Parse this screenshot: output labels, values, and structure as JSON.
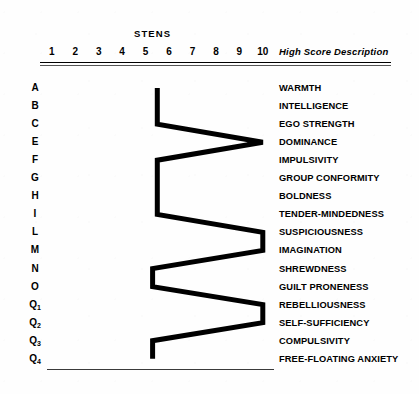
{
  "axis": {
    "factor_label": "FACTOR",
    "stens_title": "STENS",
    "high_score_header": "High Score Description",
    "tick_labels": [
      "1",
      "2",
      "3",
      "4",
      "5",
      "6",
      "7",
      "8",
      "9",
      "10"
    ]
  },
  "rows": [
    {
      "factor": "A",
      "sub": "",
      "description": "WARMTH"
    },
    {
      "factor": "B",
      "sub": "",
      "description": "INTELLIGENCE"
    },
    {
      "factor": "C",
      "sub": "",
      "description": "EGO STRENGTH"
    },
    {
      "factor": "E",
      "sub": "",
      "description": "DOMINANCE"
    },
    {
      "factor": "F",
      "sub": "",
      "description": "IMPULSIVITY"
    },
    {
      "factor": "G",
      "sub": "",
      "description": "GROUP CONFORMITY"
    },
    {
      "factor": "H",
      "sub": "",
      "description": "BOLDNESS"
    },
    {
      "factor": "I",
      "sub": "",
      "description": "TENDER-MINDEDNESS"
    },
    {
      "factor": "L",
      "sub": "",
      "description": "SUSPICIOUSNESS"
    },
    {
      "factor": "M",
      "sub": "",
      "description": "IMAGINATION"
    },
    {
      "factor": "N",
      "sub": "",
      "description": "SHREWDNESS"
    },
    {
      "factor": "O",
      "sub": "",
      "description": "GUILT PRONENESS"
    },
    {
      "factor": "Q",
      "sub": "1",
      "description": "REBELLIOUSNESS"
    },
    {
      "factor": "Q",
      "sub": "2",
      "description": "SELF-SUFFICIENCY"
    },
    {
      "factor": "Q",
      "sub": "3",
      "description": "COMPULSIVITY"
    },
    {
      "factor": "Q",
      "sub": "4",
      "description": "FREE-FLOATING ANXIETY"
    }
  ],
  "chart_data": {
    "type": "line",
    "title": "STENS",
    "xlabel": "STENS",
    "ylabel": "FACTOR",
    "xlim": [
      1,
      10
    ],
    "grid": false,
    "legend": false,
    "orientation": "horizontal-profile",
    "categories": [
      "A",
      "B",
      "C",
      "E",
      "F",
      "G",
      "H",
      "I",
      "L",
      "M",
      "N",
      "O",
      "Q1",
      "Q2",
      "Q3",
      "Q4"
    ],
    "category_descriptions": [
      "WARMTH",
      "INTELLIGENCE",
      "EGO STRENGTH",
      "DOMINANCE",
      "IMPULSIVITY",
      "GROUP CONFORMITY",
      "BOLDNESS",
      "TENDER-MINDEDNESS",
      "SUSPICIOUSNESS",
      "IMAGINATION",
      "SHREWDNESS",
      "GUILT PRONENESS",
      "REBELLIOUSNESS",
      "SELF-SUFFICIENCY",
      "COMPULSIVITY",
      "FREE-FLOATING ANXIETY"
    ],
    "values": [
      5.5,
      5.5,
      5.5,
      10,
      5.5,
      5.5,
      5.5,
      5.5,
      10,
      10,
      5.3,
      5.3,
      10,
      10,
      5.3,
      5.3
    ],
    "series": [
      {
        "name": "sten profile",
        "values": [
          5.5,
          5.5,
          5.5,
          10,
          5.5,
          5.5,
          5.5,
          5.5,
          10,
          10,
          5.3,
          5.3,
          10,
          10,
          5.3,
          5.3
        ]
      }
    ],
    "line_color": "#000000",
    "line_width": 5
  },
  "geometry": {
    "sten1_x": 51.8,
    "sten_step_x": 23.45,
    "row0_y": 88,
    "row_step_y": 18.05
  }
}
